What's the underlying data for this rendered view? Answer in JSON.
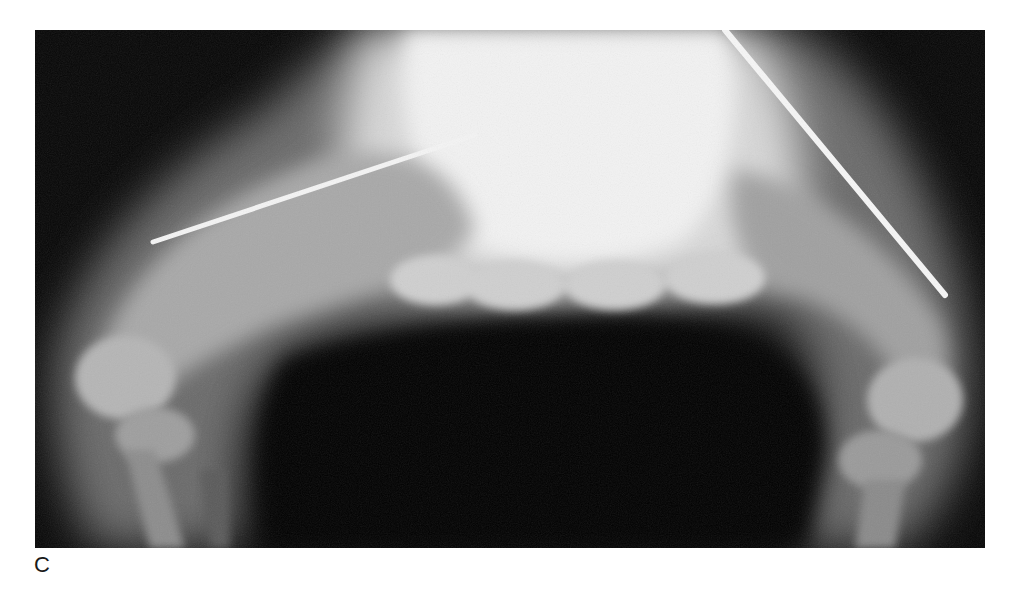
{
  "figure": {
    "panel_label": "C",
    "image_description": "Radiograph (X-ray) of flexed knees/legs with intramedullary rods in both femurs"
  }
}
